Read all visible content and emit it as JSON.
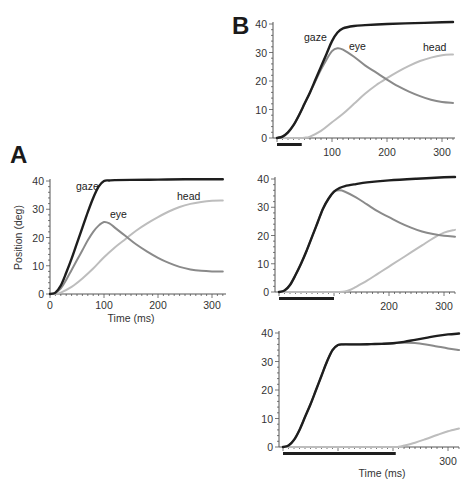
{
  "figure": {
    "panel_a_letter": "A",
    "panel_b_letter": "B"
  },
  "colors": {
    "gaze": "#1e1e1e",
    "eye": "#8a8a8a",
    "head": "#bdbdbd",
    "axis": "#555555",
    "bar": "#1e1e1e"
  },
  "chart_data": [
    {
      "id": "A",
      "type": "line",
      "title": "A",
      "xlabel": "Time (ms)",
      "ylabel": "Position (deg)",
      "xlim": [
        0,
        320
      ],
      "ylim": [
        0,
        40
      ],
      "xticks": [
        0,
        100,
        200,
        300
      ],
      "yticks": [
        0,
        10,
        20,
        30,
        40
      ],
      "grid": false,
      "box": {
        "x0": 50,
        "x100": 104,
        "y0": 294,
        "y40": 181,
        "xend": 226
      },
      "labels": [
        {
          "text": "gaze",
          "x": 76,
          "y": 190
        },
        {
          "text": "eye",
          "x": 110,
          "y": 218
        },
        {
          "text": "head",
          "x": 177,
          "y": 200
        }
      ],
      "series": [
        {
          "name": "gaze",
          "x": [
            0,
            10,
            20,
            30,
            40,
            50,
            60,
            70,
            80,
            90,
            100,
            110,
            120,
            150,
            200,
            250,
            300,
            320
          ],
          "y": [
            0,
            0.5,
            3,
            7.5,
            12.5,
            18,
            23.5,
            29,
            34,
            38,
            40,
            40.2,
            40.3,
            40.4,
            40.5,
            40.6,
            40.6,
            40.6
          ]
        },
        {
          "name": "eye",
          "x": [
            0,
            10,
            20,
            30,
            40,
            50,
            60,
            70,
            80,
            90,
            100,
            110,
            120,
            140,
            160,
            180,
            200,
            220,
            240,
            260,
            280,
            300,
            320
          ],
          "y": [
            0,
            0.4,
            2,
            5,
            8.5,
            12,
            15.5,
            19,
            22,
            24.2,
            25.5,
            25,
            23.5,
            20.5,
            17.5,
            15,
            12.8,
            11,
            9.6,
            8.7,
            8.2,
            8,
            8
          ]
        },
        {
          "name": "head",
          "x": [
            0,
            10,
            20,
            40,
            60,
            80,
            100,
            120,
            140,
            160,
            180,
            200,
            220,
            240,
            260,
            280,
            300,
            320
          ],
          "y": [
            0,
            0.1,
            0.5,
            2.5,
            5.5,
            9,
            13,
            16.5,
            19.5,
            22.5,
            25,
            27.2,
            29.2,
            30.8,
            31.9,
            32.6,
            33,
            33.1
          ]
        }
      ]
    },
    {
      "id": "B1",
      "type": "line",
      "title": "B",
      "xlabel": "",
      "ylabel": "",
      "xlim": [
        0,
        320
      ],
      "ylim": [
        0,
        40
      ],
      "xticks": [
        100,
        200,
        300
      ],
      "yticks": [
        0,
        10,
        20,
        30,
        40
      ],
      "grid": false,
      "stimulus_bar_ms": [
        0,
        45
      ],
      "box": {
        "x0": 277,
        "x100": 332,
        "y0": 138,
        "y40": 24,
        "xend": 455,
        "yaxis_x": 273
      },
      "labels": [
        {
          "text": "gaze",
          "x": 304,
          "y": 41
        },
        {
          "text": "eye",
          "x": 349,
          "y": 50
        },
        {
          "text": "head",
          "x": 423,
          "y": 51
        }
      ],
      "series": [
        {
          "name": "gaze",
          "x": [
            0,
            10,
            20,
            30,
            40,
            50,
            60,
            70,
            80,
            90,
            100,
            110,
            120,
            140,
            160,
            200,
            250,
            300,
            320
          ],
          "y": [
            0,
            0.5,
            2,
            4.5,
            8,
            12,
            16,
            20.5,
            25,
            29.5,
            34,
            37,
            38.5,
            39.3,
            39.6,
            40,
            40.3,
            40.6,
            40.7
          ]
        },
        {
          "name": "eye",
          "x": [
            0,
            10,
            20,
            30,
            40,
            50,
            60,
            70,
            80,
            90,
            100,
            110,
            120,
            140,
            160,
            180,
            200,
            220,
            240,
            260,
            280,
            300,
            320
          ],
          "y": [
            0,
            0.5,
            2,
            4.5,
            8,
            12,
            16,
            20,
            24,
            27.5,
            30.5,
            31.5,
            31,
            28.5,
            25.5,
            23,
            20.5,
            18.2,
            16.3,
            14.7,
            13.4,
            12.6,
            12.3
          ]
        },
        {
          "name": "head",
          "x": [
            0,
            20,
            40,
            50,
            60,
            80,
            100,
            120,
            140,
            160,
            180,
            200,
            220,
            240,
            260,
            280,
            300,
            320
          ],
          "y": [
            0,
            0,
            0,
            0.1,
            0.5,
            2.5,
            5.5,
            8.5,
            12,
            15.5,
            18.5,
            21,
            23.3,
            25.3,
            27,
            28.2,
            29,
            29.3
          ]
        }
      ]
    },
    {
      "id": "B2",
      "type": "line",
      "title": "",
      "xlabel": "",
      "ylabel": "",
      "xlim": [
        0,
        320
      ],
      "ylim": [
        0,
        40
      ],
      "xticks": [
        200,
        300
      ],
      "yticks": [
        0,
        10,
        20,
        30,
        40
      ],
      "grid": false,
      "stimulus_bar_ms": [
        0,
        100
      ],
      "box": {
        "x0": 279,
        "x100": 334,
        "y0": 292,
        "y40": 179,
        "xend": 455,
        "yaxis_x": 275
      },
      "labels": [],
      "series": [
        {
          "name": "gaze",
          "x": [
            0,
            10,
            20,
            30,
            40,
            50,
            60,
            70,
            80,
            90,
            100,
            110,
            120,
            140,
            160,
            200,
            250,
            300,
            320
          ],
          "y": [
            0,
            0.5,
            2.5,
            6,
            10,
            14.5,
            19.5,
            24.5,
            29.5,
            33,
            35.5,
            36.8,
            37.5,
            38.2,
            38.8,
            39.5,
            40.1,
            40.6,
            40.7
          ]
        },
        {
          "name": "eye",
          "x": [
            0,
            10,
            20,
            30,
            40,
            50,
            60,
            70,
            80,
            90,
            100,
            110,
            120,
            140,
            160,
            180,
            200,
            220,
            240,
            260,
            280,
            300,
            320
          ],
          "y": [
            0,
            0.5,
            2.5,
            6,
            10,
            14.5,
            19.5,
            24.5,
            29.5,
            33,
            35.5,
            36,
            35.5,
            33.5,
            31,
            28.5,
            26.5,
            24.5,
            22.8,
            21.4,
            20.5,
            19.9,
            19.6
          ]
        },
        {
          "name": "head",
          "x": [
            0,
            60,
            100,
            110,
            120,
            130,
            140,
            160,
            180,
            200,
            220,
            240,
            260,
            280,
            300,
            320
          ],
          "y": [
            0,
            0,
            0,
            0,
            0.2,
            0.8,
            1.8,
            4,
            6.5,
            9,
            11.5,
            14,
            16.5,
            19,
            21,
            22
          ]
        }
      ]
    },
    {
      "id": "B3",
      "type": "line",
      "title": "",
      "xlabel": "Time (ms)",
      "ylabel": "",
      "xlim": [
        0,
        320
      ],
      "ylim": [
        0,
        40
      ],
      "xticks": [
        300
      ],
      "yticks": [
        0,
        10,
        20,
        30,
        40
      ],
      "grid": false,
      "stimulus_bar_ms": [
        0,
        205
      ],
      "box": {
        "x0": 283,
        "x100": 338,
        "y0": 447,
        "y40": 333,
        "xend": 459,
        "yaxis_x": 279
      },
      "labels": [],
      "series": [
        {
          "name": "gaze",
          "x": [
            0,
            10,
            20,
            30,
            40,
            50,
            60,
            70,
            80,
            90,
            100,
            110,
            120,
            140,
            160,
            180,
            200,
            220,
            240,
            260,
            280,
            300,
            320
          ],
          "y": [
            0,
            0.5,
            2.5,
            6,
            10.5,
            15,
            20,
            25,
            30,
            34,
            35.8,
            36,
            36,
            36,
            36.1,
            36.2,
            36.4,
            36.9,
            37.6,
            38.3,
            39,
            39.5,
            39.8
          ]
        },
        {
          "name": "eye",
          "x": [
            0,
            10,
            20,
            30,
            40,
            50,
            60,
            70,
            80,
            90,
            100,
            110,
            120,
            140,
            160,
            180,
            200,
            220,
            240,
            260,
            280,
            300,
            320
          ],
          "y": [
            0,
            0.5,
            2.5,
            6,
            10.5,
            15,
            20,
            25,
            30,
            34,
            35.8,
            36,
            36,
            36,
            36.1,
            36.2,
            36.4,
            36.6,
            36.5,
            36,
            35.3,
            34.6,
            34
          ]
        },
        {
          "name": "head",
          "x": [
            0,
            200,
            210,
            220,
            240,
            260,
            280,
            300,
            320
          ],
          "y": [
            0,
            0,
            0.1,
            0.5,
            1.5,
            2.8,
            4.2,
            5.5,
            6.5
          ]
        }
      ]
    }
  ]
}
